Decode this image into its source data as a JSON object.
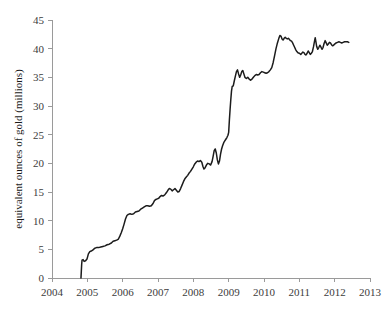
{
  "chart_data": {
    "type": "line",
    "title": "",
    "subtitle": "",
    "xlabel": "",
    "ylabel": "equivalent ounces of gold (millions)",
    "xlim": [
      2004,
      2013
    ],
    "ylim": [
      0,
      45
    ],
    "grid": false,
    "legend": null,
    "x_ticks": [
      "2004",
      "2005",
      "2006",
      "2007",
      "2008",
      "2009",
      "2010",
      "2011",
      "2012",
      "2013"
    ],
    "y_ticks": [
      "0",
      "5",
      "10",
      "15",
      "20",
      "25",
      "30",
      "35",
      "40",
      "45"
    ],
    "line_color": "#1c1c1c",
    "series": [
      {
        "name": "equivalent ounces of gold",
        "points": [
          [
            2004.82,
            0.0
          ],
          [
            2004.83,
            1.2
          ],
          [
            2004.84,
            2.4
          ],
          [
            2004.85,
            3.1
          ],
          [
            2004.88,
            3.2
          ],
          [
            2004.91,
            2.9
          ],
          [
            2004.95,
            3.0
          ],
          [
            2004.99,
            3.3
          ],
          [
            2005.03,
            4.2
          ],
          [
            2005.07,
            4.6
          ],
          [
            2005.11,
            4.7
          ],
          [
            2005.16,
            4.9
          ],
          [
            2005.21,
            5.2
          ],
          [
            2005.26,
            5.3
          ],
          [
            2005.32,
            5.3
          ],
          [
            2005.38,
            5.4
          ],
          [
            2005.44,
            5.5
          ],
          [
            2005.5,
            5.6
          ],
          [
            2005.56,
            5.8
          ],
          [
            2005.62,
            5.9
          ],
          [
            2005.68,
            6.1
          ],
          [
            2005.73,
            6.4
          ],
          [
            2005.78,
            6.5
          ],
          [
            2005.83,
            6.6
          ],
          [
            2005.88,
            6.8
          ],
          [
            2005.92,
            7.3
          ],
          [
            2005.96,
            7.9
          ],
          [
            2006.0,
            8.6
          ],
          [
            2006.04,
            9.4
          ],
          [
            2006.08,
            10.3
          ],
          [
            2006.12,
            10.9
          ],
          [
            2006.16,
            11.1
          ],
          [
            2006.21,
            11.2
          ],
          [
            2006.26,
            11.1
          ],
          [
            2006.31,
            11.2
          ],
          [
            2006.36,
            11.5
          ],
          [
            2006.41,
            11.6
          ],
          [
            2006.46,
            11.7
          ],
          [
            2006.51,
            12.0
          ],
          [
            2006.56,
            12.2
          ],
          [
            2006.61,
            12.4
          ],
          [
            2006.66,
            12.6
          ],
          [
            2006.71,
            12.6
          ],
          [
            2006.76,
            12.5
          ],
          [
            2006.81,
            12.6
          ],
          [
            2006.86,
            13.0
          ],
          [
            2006.9,
            13.5
          ],
          [
            2006.94,
            13.7
          ],
          [
            2006.98,
            13.8
          ],
          [
            2007.02,
            13.9
          ],
          [
            2007.06,
            14.2
          ],
          [
            2007.1,
            14.4
          ],
          [
            2007.14,
            14.3
          ],
          [
            2007.19,
            14.5
          ],
          [
            2007.24,
            14.9
          ],
          [
            2007.28,
            15.3
          ],
          [
            2007.32,
            15.6
          ],
          [
            2007.36,
            15.5
          ],
          [
            2007.4,
            15.2
          ],
          [
            2007.44,
            15.4
          ],
          [
            2007.48,
            15.6
          ],
          [
            2007.52,
            15.3
          ],
          [
            2007.56,
            15.0
          ],
          [
            2007.6,
            15.1
          ],
          [
            2007.64,
            15.6
          ],
          [
            2007.68,
            16.2
          ],
          [
            2007.72,
            16.8
          ],
          [
            2007.76,
            17.3
          ],
          [
            2007.8,
            17.6
          ],
          [
            2007.84,
            17.9
          ],
          [
            2007.88,
            18.3
          ],
          [
            2007.92,
            18.6
          ],
          [
            2007.96,
            19.0
          ],
          [
            2008.0,
            19.4
          ],
          [
            2008.04,
            19.9
          ],
          [
            2008.08,
            20.2
          ],
          [
            2008.12,
            20.4
          ],
          [
            2008.16,
            20.3
          ],
          [
            2008.2,
            20.5
          ],
          [
            2008.24,
            20.2
          ],
          [
            2008.27,
            19.5
          ],
          [
            2008.3,
            19.0
          ],
          [
            2008.33,
            19.2
          ],
          [
            2008.37,
            19.7
          ],
          [
            2008.41,
            20.0
          ],
          [
            2008.45,
            19.9
          ],
          [
            2008.49,
            19.7
          ],
          [
            2008.53,
            20.3
          ],
          [
            2008.56,
            21.2
          ],
          [
            2008.59,
            22.2
          ],
          [
            2008.62,
            22.5
          ],
          [
            2008.65,
            21.8
          ],
          [
            2008.68,
            20.6
          ],
          [
            2008.71,
            19.9
          ],
          [
            2008.74,
            20.4
          ],
          [
            2008.77,
            21.6
          ],
          [
            2008.8,
            22.5
          ],
          [
            2008.83,
            23.1
          ],
          [
            2008.86,
            23.6
          ],
          [
            2008.89,
            23.9
          ],
          [
            2008.92,
            24.2
          ],
          [
            2008.95,
            24.5
          ],
          [
            2008.98,
            24.9
          ],
          [
            2009.0,
            25.4
          ],
          [
            2009.02,
            27.5
          ],
          [
            2009.04,
            29.4
          ],
          [
            2009.06,
            31.1
          ],
          [
            2009.08,
            32.6
          ],
          [
            2009.1,
            33.4
          ],
          [
            2009.13,
            33.5
          ],
          [
            2009.16,
            34.4
          ],
          [
            2009.19,
            35.2
          ],
          [
            2009.22,
            36.0
          ],
          [
            2009.25,
            36.3
          ],
          [
            2009.28,
            35.6
          ],
          [
            2009.31,
            35.0
          ],
          [
            2009.34,
            35.4
          ],
          [
            2009.37,
            36.0
          ],
          [
            2009.4,
            36.2
          ],
          [
            2009.43,
            35.6
          ],
          [
            2009.46,
            35.0
          ],
          [
            2009.5,
            34.8
          ],
          [
            2009.54,
            35.0
          ],
          [
            2009.58,
            34.7
          ],
          [
            2009.62,
            34.5
          ],
          [
            2009.66,
            34.7
          ],
          [
            2009.7,
            35.0
          ],
          [
            2009.74,
            35.3
          ],
          [
            2009.78,
            35.5
          ],
          [
            2009.82,
            35.4
          ],
          [
            2009.86,
            35.5
          ],
          [
            2009.9,
            35.8
          ],
          [
            2009.94,
            36.0
          ],
          [
            2009.98,
            35.9
          ],
          [
            2010.02,
            35.8
          ],
          [
            2010.06,
            35.7
          ],
          [
            2010.1,
            35.8
          ],
          [
            2010.14,
            36.0
          ],
          [
            2010.18,
            36.3
          ],
          [
            2010.22,
            36.7
          ],
          [
            2010.26,
            37.6
          ],
          [
            2010.3,
            38.8
          ],
          [
            2010.34,
            40.0
          ],
          [
            2010.38,
            41.0
          ],
          [
            2010.42,
            41.8
          ],
          [
            2010.45,
            42.3
          ],
          [
            2010.48,
            42.2
          ],
          [
            2010.51,
            41.7
          ],
          [
            2010.54,
            41.5
          ],
          [
            2010.57,
            41.8
          ],
          [
            2010.6,
            42.0
          ],
          [
            2010.63,
            41.8
          ],
          [
            2010.66,
            41.7
          ],
          [
            2010.69,
            41.8
          ],
          [
            2010.72,
            41.6
          ],
          [
            2010.75,
            41.4
          ],
          [
            2010.78,
            41.3
          ],
          [
            2010.81,
            41.0
          ],
          [
            2010.84,
            40.6
          ],
          [
            2010.87,
            40.2
          ],
          [
            2010.9,
            39.8
          ],
          [
            2010.93,
            39.5
          ],
          [
            2010.96,
            39.3
          ],
          [
            2011.0,
            39.2
          ],
          [
            2011.04,
            39.0
          ],
          [
            2011.07,
            39.2
          ],
          [
            2011.1,
            39.4
          ],
          [
            2011.13,
            39.3
          ],
          [
            2011.16,
            39.0
          ],
          [
            2011.19,
            38.9
          ],
          [
            2011.22,
            39.2
          ],
          [
            2011.25,
            39.6
          ],
          [
            2011.28,
            39.3
          ],
          [
            2011.31,
            39.0
          ],
          [
            2011.34,
            39.2
          ],
          [
            2011.37,
            39.5
          ],
          [
            2011.4,
            40.3
          ],
          [
            2011.43,
            41.3
          ],
          [
            2011.45,
            41.9
          ],
          [
            2011.47,
            41.2
          ],
          [
            2011.49,
            40.4
          ],
          [
            2011.52,
            39.9
          ],
          [
            2011.55,
            40.2
          ],
          [
            2011.58,
            40.6
          ],
          [
            2011.61,
            40.3
          ],
          [
            2011.64,
            39.9
          ],
          [
            2011.67,
            40.2
          ],
          [
            2011.7,
            40.9
          ],
          [
            2011.73,
            41.4
          ],
          [
            2011.76,
            41.0
          ],
          [
            2011.79,
            40.6
          ],
          [
            2011.82,
            40.8
          ],
          [
            2011.85,
            41.1
          ],
          [
            2011.88,
            41.0
          ],
          [
            2011.91,
            40.7
          ],
          [
            2011.94,
            40.5
          ],
          [
            2011.97,
            40.6
          ],
          [
            2012.0,
            40.8
          ],
          [
            2012.04,
            41.0
          ],
          [
            2012.08,
            41.1
          ],
          [
            2012.12,
            41.2
          ],
          [
            2012.16,
            41.1
          ],
          [
            2012.2,
            41.0
          ],
          [
            2012.24,
            41.1
          ],
          [
            2012.28,
            41.2
          ],
          [
            2012.32,
            41.2
          ],
          [
            2012.36,
            41.2
          ],
          [
            2012.4,
            41.1
          ]
        ]
      }
    ]
  }
}
